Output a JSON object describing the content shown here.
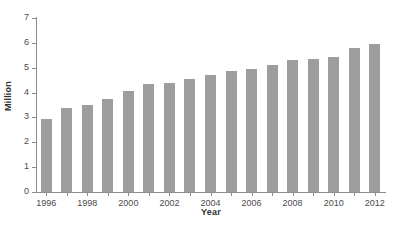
{
  "chart_data": {
    "type": "bar",
    "title": "",
    "xlabel": "Year",
    "ylabel": "Million",
    "ylim": [
      0,
      7
    ],
    "ytick_labels": [
      "0",
      "1",
      "2",
      "3",
      "4",
      "5",
      "6",
      "7"
    ],
    "yticks": [
      0,
      1,
      2,
      3,
      4,
      5,
      6,
      7
    ],
    "grid": false,
    "legend": null,
    "bar_color": "#9d9d9d",
    "axis_color": "#8c8c8c",
    "categories": [
      "1996",
      "1997",
      "1998",
      "1999",
      "2000",
      "2001",
      "2002",
      "2003",
      "2004",
      "2005",
      "2006",
      "2007",
      "2008",
      "2009",
      "2010",
      "2011",
      "2012"
    ],
    "xtick_labels": [
      "1996",
      "",
      "1998",
      "",
      "2000",
      "",
      "2002",
      "",
      "2004",
      "",
      "2006",
      "",
      "2008",
      "",
      "2010",
      "",
      "2012"
    ],
    "values": [
      2.93,
      3.4,
      3.5,
      3.75,
      4.05,
      4.35,
      4.4,
      4.55,
      4.7,
      4.85,
      4.95,
      5.1,
      5.3,
      5.35,
      5.45,
      5.8,
      5.95
    ]
  }
}
